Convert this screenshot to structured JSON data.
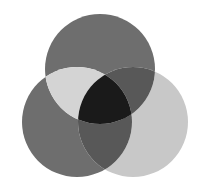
{
  "figure": {
    "name": "three-circle-venn-diagram",
    "title": "Three overlapping circles",
    "width": 201,
    "height": 191,
    "background_color": "#ffffff"
  },
  "chart_data": {
    "type": "diagram",
    "subtype": "venn",
    "title": "",
    "set_count": 3,
    "radius": 55,
    "circles": [
      {
        "id": "top",
        "label": "",
        "cx": 100,
        "cy": 69,
        "r": 55,
        "fill": "#6e6e6e"
      },
      {
        "id": "bottom-left",
        "label": "",
        "cx": 77,
        "cy": 122,
        "r": 55,
        "fill": "#6e6e6e"
      },
      {
        "id": "bottom-right",
        "label": "",
        "cx": 133,
        "cy": 122,
        "r": 55,
        "fill": "#c8c8c8"
      }
    ],
    "regions": [
      {
        "id": "top-only",
        "members": [
          "top"
        ],
        "fill": "#6e6e6e"
      },
      {
        "id": "bottom-left-only",
        "members": [
          "bottom-left"
        ],
        "fill": "#6e6e6e"
      },
      {
        "id": "bottom-right-only",
        "members": [
          "bottom-right"
        ],
        "fill": "#c8c8c8"
      },
      {
        "id": "top-and-bottom-left",
        "members": [
          "top",
          "bottom-left"
        ],
        "fill": "#d4d4d4"
      },
      {
        "id": "top-and-bottom-right",
        "members": [
          "top",
          "bottom-right"
        ],
        "fill": "#585858"
      },
      {
        "id": "bottom-left-and-bottom-right",
        "members": [
          "bottom-left",
          "bottom-right"
        ],
        "fill": "#585858"
      },
      {
        "id": "all-three",
        "members": [
          "top",
          "bottom-left",
          "bottom-right"
        ],
        "fill": "#1a1a1a"
      }
    ],
    "legend": [],
    "annotations": []
  }
}
